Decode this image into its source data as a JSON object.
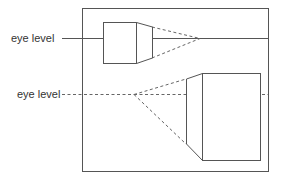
{
  "diagram": {
    "labels": {
      "top_eye_level": "eye level",
      "bottom_eye_level": "eye level"
    },
    "colors": {
      "line": "#555555",
      "dashed": "#666666",
      "text": "#333333",
      "background": "#ffffff"
    },
    "frame": {
      "x": 82,
      "y": 8,
      "width": 186,
      "height": 163
    },
    "top_scene": {
      "eye_level_y": 38,
      "eye_level_style": "solid",
      "vanishing_point": [
        200,
        38
      ],
      "box": {
        "x": 103,
        "y": 22,
        "width": 33,
        "height": 41
      },
      "side_face": {
        "near_x": 136,
        "far_x": 152,
        "far_top": 27,
        "far_bottom": 58
      }
    },
    "bottom_scene": {
      "eye_level_y": 94,
      "eye_level_style": "dashed",
      "vanishing_point": [
        134,
        94
      ],
      "box": {
        "x": 202,
        "y": 73,
        "width": 58,
        "height": 87
      },
      "side_face": {
        "near_x": 202,
        "far_x": 186,
        "far_top": 79,
        "far_bottom": 144
      }
    }
  }
}
